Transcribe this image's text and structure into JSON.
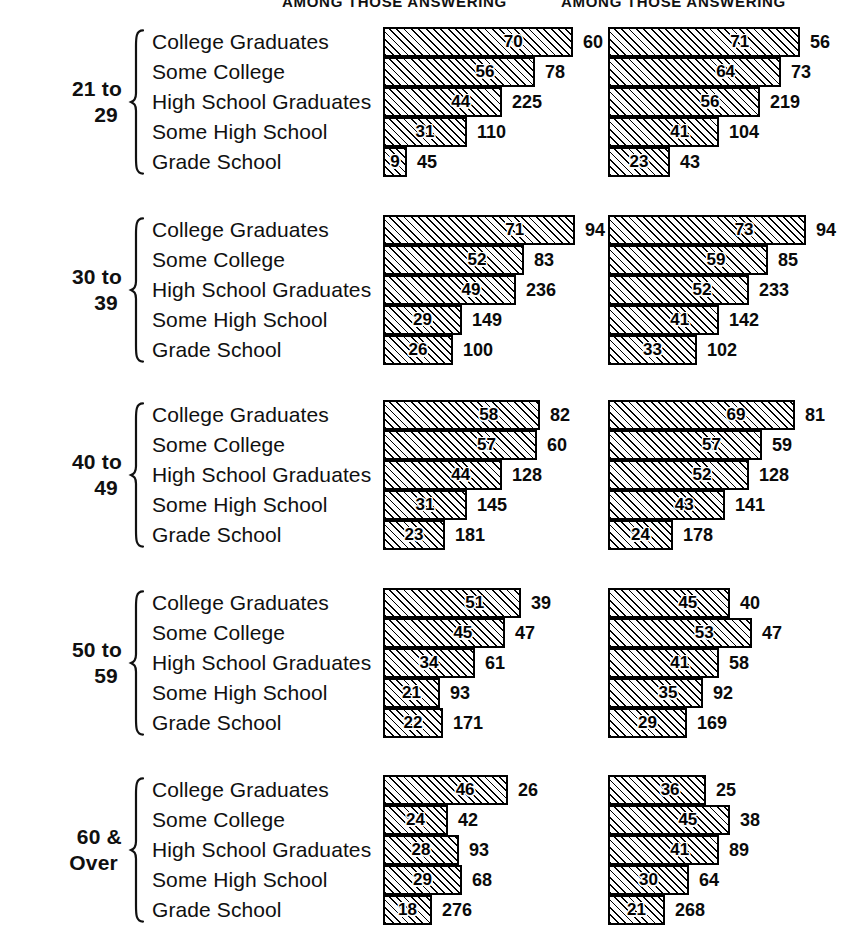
{
  "headers": {
    "col1": "AMONG THOSE ANSWERING",
    "col2": "AMONG THOSE ANSWERING"
  },
  "education_levels": [
    "College Graduates",
    "Some College",
    "High School Graduates",
    "Some High School",
    "Grade School"
  ],
  "age_groups": [
    {
      "line1": "21 to",
      "line2": "29"
    },
    {
      "line1": "30 to",
      "line2": "39"
    },
    {
      "line1": "40 to",
      "line2": "49"
    },
    {
      "line1": "50 to",
      "line2": "59"
    },
    {
      "line1": "60 &",
      "line2": "Over"
    }
  ],
  "chart_data": {
    "type": "bar",
    "title": "",
    "xlabel": "",
    "ylabel": "",
    "xlim": [
      0,
      100
    ],
    "grid": false,
    "legend_position": "none",
    "orientation": "horizontal",
    "value_unit": "percent",
    "bar_value_label": "percentage inside bar",
    "outside_label": "base count (number answering)",
    "categories": [
      "College Graduates",
      "Some College",
      "High School Graduates",
      "Some High School",
      "Grade School"
    ],
    "groups": [
      {
        "age": "21 to 29",
        "series": [
          {
            "name": "AMONG THOSE ANSWERING (column 1)",
            "percents": [
              70,
              56,
              44,
              31,
              9
            ],
            "counts": [
              60,
              78,
              225,
              110,
              45
            ]
          },
          {
            "name": "AMONG THOSE ANSWERING (column 2)",
            "percents": [
              71,
              64,
              56,
              41,
              23
            ],
            "counts": [
              56,
              73,
              219,
              104,
              43
            ]
          }
        ]
      },
      {
        "age": "30 to 39",
        "series": [
          {
            "name": "AMONG THOSE ANSWERING (column 1)",
            "percents": [
              71,
              52,
              49,
              29,
              26
            ],
            "counts": [
              94,
              83,
              236,
              149,
              100
            ]
          },
          {
            "name": "AMONG THOSE ANSWERING (column 2)",
            "percents": [
              73,
              59,
              52,
              41,
              33
            ],
            "counts": [
              94,
              85,
              233,
              142,
              102
            ]
          }
        ]
      },
      {
        "age": "40 to 49",
        "series": [
          {
            "name": "AMONG THOSE ANSWERING (column 1)",
            "percents": [
              58,
              57,
              44,
              31,
              23
            ],
            "counts": [
              82,
              60,
              128,
              145,
              181
            ]
          },
          {
            "name": "AMONG THOSE ANSWERING (column 2)",
            "percents": [
              69,
              57,
              52,
              43,
              24
            ],
            "counts": [
              81,
              59,
              128,
              141,
              178
            ]
          }
        ]
      },
      {
        "age": "50 to 59",
        "series": [
          {
            "name": "AMONG THOSE ANSWERING (column 1)",
            "percents": [
              51,
              45,
              34,
              21,
              22
            ],
            "counts": [
              39,
              47,
              61,
              93,
              171
            ]
          },
          {
            "name": "AMONG THOSE ANSWERING (column 2)",
            "percents": [
              45,
              53,
              41,
              35,
              29
            ],
            "counts": [
              40,
              47,
              58,
              92,
              169
            ]
          }
        ]
      },
      {
        "age": "60 & Over",
        "series": [
          {
            "name": "AMONG THOSE ANSWERING (column 1)",
            "percents": [
              46,
              24,
              28,
              29,
              18
            ],
            "counts": [
              26,
              42,
              93,
              68,
              276
            ]
          },
          {
            "name": "AMONG THOSE ANSWERING (column 2)",
            "percents": [
              36,
              45,
              41,
              30,
              21
            ],
            "counts": [
              25,
              38,
              89,
              64,
              268
            ]
          }
        ]
      }
    ]
  },
  "style": {
    "ink": "#101010",
    "paper": "#ffffff",
    "bar_fill": "#fdfdfd",
    "hatch": "#000000"
  }
}
